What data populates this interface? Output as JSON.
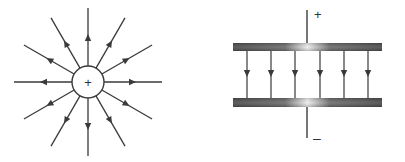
{
  "diagrams": [
    {
      "id": "point-charge",
      "title": "Electric field of a positive point charge",
      "charge_symbol": "+",
      "field_line_count": 12,
      "field_direction": "outward",
      "center": [
        88,
        82
      ],
      "charge_radius": 16,
      "line_length": 74
    },
    {
      "id": "parallel-plates",
      "title": "Uniform field between parallel plates",
      "top_terminal_symbol": "+",
      "bottom_terminal_symbol": "–",
      "field_line_count": 6,
      "field_direction": "downward",
      "field_line_x": [
        247,
        271,
        295,
        320,
        344,
        368
      ]
    }
  ],
  "colors": {
    "line": "#3a3a3a",
    "plate_dark": "#505050",
    "plate_light": "#e8e8e8",
    "background": "#ffffff"
  }
}
